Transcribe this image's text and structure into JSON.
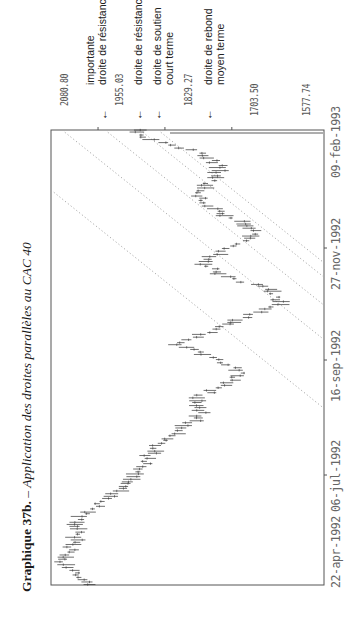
{
  "title": {
    "bold": "Graphique 37b.",
    "dash": " – ",
    "italic": "Application des droites parallèles au CAC 40"
  },
  "price_labels": [
    "2080.80",
    "1955.03",
    "1829.27",
    "1703.50",
    "1577.74"
  ],
  "annotations": [
    {
      "lines": [
        "importante",
        "droite de résistance"
      ],
      "arrow": "←"
    },
    {
      "lines": [
        "droite de résistance"
      ],
      "arrow": "←"
    },
    {
      "lines": [
        "droite de soutien",
        "court terme"
      ],
      "arrow": "←"
    },
    {
      "lines": [
        "droite de rebond",
        "moyen terme"
      ],
      "arrow": "←"
    }
  ],
  "date_labels": [
    "22-apr-1992",
    "06-jul-1992",
    "16-sep-1992",
    "27-nov-1992",
    "09-feb-1993"
  ],
  "chart_data": {
    "type": "line",
    "title": "Graphique 37b. – Application des droites parallèles au CAC 40",
    "orientation": "rotated 90° counter-clockwise (time runs bottom→top, price decreases left→right)",
    "xlabel": "Date",
    "ylabel": "CAC 40",
    "x_ticks": [
      "22-apr-1992",
      "06-jul-1992",
      "16-sep-1992",
      "27-nov-1992",
      "09-feb-1993"
    ],
    "y_ticks": [
      2080.8,
      1955.03,
      1829.27,
      1703.5,
      1577.74
    ],
    "ylim": [
      1577.74,
      2080.8
    ],
    "series": [
      {
        "name": "CAC 40 (high-low bars, approx. centers)",
        "points": [
          {
            "t": 0.0,
            "v": 2010
          },
          {
            "t": 0.03,
            "v": 2040
          },
          {
            "t": 0.05,
            "v": 2066
          },
          {
            "t": 0.08,
            "v": 2045
          },
          {
            "t": 0.11,
            "v": 2030
          },
          {
            "t": 0.14,
            "v": 2040
          },
          {
            "t": 0.17,
            "v": 2000
          },
          {
            "t": 0.2,
            "v": 1965
          },
          {
            "t": 0.23,
            "v": 1935
          },
          {
            "t": 0.26,
            "v": 1915
          },
          {
            "t": 0.29,
            "v": 1895
          },
          {
            "t": 0.32,
            "v": 1870
          },
          {
            "t": 0.35,
            "v": 1830
          },
          {
            "t": 0.38,
            "v": 1800
          },
          {
            "t": 0.41,
            "v": 1815
          },
          {
            "t": 0.44,
            "v": 1760
          },
          {
            "t": 0.47,
            "v": 1730
          },
          {
            "t": 0.5,
            "v": 1790
          },
          {
            "t": 0.53,
            "v": 1850
          },
          {
            "t": 0.56,
            "v": 1780
          },
          {
            "t": 0.59,
            "v": 1720
          },
          {
            "t": 0.62,
            "v": 1660
          },
          {
            "t": 0.65,
            "v": 1680
          },
          {
            "t": 0.68,
            "v": 1760
          },
          {
            "t": 0.71,
            "v": 1800
          },
          {
            "t": 0.74,
            "v": 1760
          },
          {
            "t": 0.77,
            "v": 1700
          },
          {
            "t": 0.8,
            "v": 1730
          },
          {
            "t": 0.83,
            "v": 1790
          },
          {
            "t": 0.86,
            "v": 1815
          },
          {
            "t": 0.89,
            "v": 1780
          },
          {
            "t": 0.92,
            "v": 1770
          },
          {
            "t": 0.95,
            "v": 1800
          },
          {
            "t": 0.98,
            "v": 1900
          },
          {
            "t": 1.0,
            "v": 1920
          }
        ]
      }
    ],
    "trend_lines": [
      {
        "name": "importante droite de résistance",
        "style": "dotted"
      },
      {
        "name": "droite de résistance",
        "style": "dotted"
      },
      {
        "name": "droite de soutien court terme",
        "style": "dotted"
      },
      {
        "name": "droite de rebond moyen terme",
        "style": "dotted"
      },
      {
        "name": "parallel channel line",
        "style": "dotted"
      }
    ],
    "grid": false,
    "legend": "annotations with arrows above chart"
  }
}
